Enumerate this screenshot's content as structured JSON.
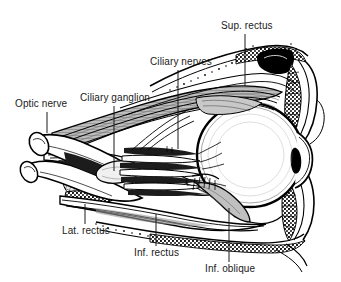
{
  "figure": {
    "type": "anatomical-line-drawing",
    "style": "black-and-white engraving / line art",
    "background_color": "#ffffff",
    "ink_color": "#000000",
    "shading_color": "#9a9a9a",
    "width": 341,
    "height": 282
  },
  "labels": [
    {
      "id": "optic-nerve",
      "text": "Optic nerve",
      "x": 15,
      "y": 98,
      "leader": {
        "x1": 47,
        "y1": 112,
        "x2": 47,
        "y2": 133
      }
    },
    {
      "id": "ciliary-ganglion",
      "text": "Ciliary ganglion",
      "x": 80,
      "y": 92,
      "leader": {
        "x1": 114,
        "y1": 106,
        "x2": 114,
        "y2": 171
      }
    },
    {
      "id": "ciliary-nerves",
      "text": "Ciliary nerves",
      "x": 150,
      "y": 56,
      "leader": {
        "x1": 178,
        "y1": 70,
        "x2": 178,
        "y2": 149
      }
    },
    {
      "id": "sup-rectus",
      "text": "Sup. rectus",
      "x": 221,
      "y": 20,
      "leader": {
        "x1": 245,
        "y1": 34,
        "x2": 245,
        "y2": 86
      }
    },
    {
      "id": "lat-rectus",
      "text": "Lat. rectus",
      "x": 62,
      "y": 225,
      "leader": {
        "x1": 85,
        "y1": 204,
        "x2": 85,
        "y2": 224
      }
    },
    {
      "id": "inf-rectus",
      "text": "Inf. rectus",
      "x": 134,
      "y": 247,
      "leader": {
        "x1": 156,
        "y1": 214,
        "x2": 156,
        "y2": 246
      }
    },
    {
      "id": "inf-oblique",
      "text": "Inf. oblique",
      "x": 205,
      "y": 263,
      "leader": {
        "x1": 229,
        "y1": 208,
        "x2": 229,
        "y2": 262
      }
    }
  ],
  "structures": [
    {
      "id": "globe",
      "name": "Eyeball (globe)"
    },
    {
      "id": "cornea",
      "name": "Cornea"
    },
    {
      "id": "pupil",
      "name": "Pupil"
    },
    {
      "id": "upper-eyelid",
      "name": "Upper eyelid with tarsal plate"
    },
    {
      "id": "lower-eyelid",
      "name": "Lower eyelid with tarsal plate"
    },
    {
      "id": "orbital-roof",
      "name": "Orbital roof (frontal bone)"
    },
    {
      "id": "orbital-floor",
      "name": "Orbital floor (maxilla)"
    },
    {
      "id": "optic-nerve-trunk",
      "name": "Optic nerve trunk"
    },
    {
      "id": "ciliary-nerve-bundle",
      "name": "Short and long ciliary nerves"
    },
    {
      "id": "superior-rectus-belly",
      "name": "Superior rectus muscle belly"
    },
    {
      "id": "lateral-rectus-belly",
      "name": "Lateral rectus muscle belly"
    },
    {
      "id": "inferior-rectus-belly",
      "name": "Inferior rectus muscle belly"
    },
    {
      "id": "inferior-oblique-belly",
      "name": "Inferior oblique muscle belly"
    }
  ]
}
